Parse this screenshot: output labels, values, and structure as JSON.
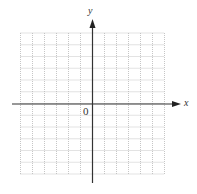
{
  "diagram": {
    "type": "coordinate-plane",
    "x_axis_label": "x",
    "y_axis_label": "y",
    "origin_label": "0",
    "grid": {
      "columns": 12,
      "rows": 12,
      "columns_left_of_y_axis": 6,
      "columns_right_of_y_axis": 6,
      "rows_above_x_axis": 6,
      "rows_below_x_axis": 6,
      "line_style": "dotted",
      "line_color": "#b8b8b8"
    },
    "axis_color": "#333333"
  }
}
